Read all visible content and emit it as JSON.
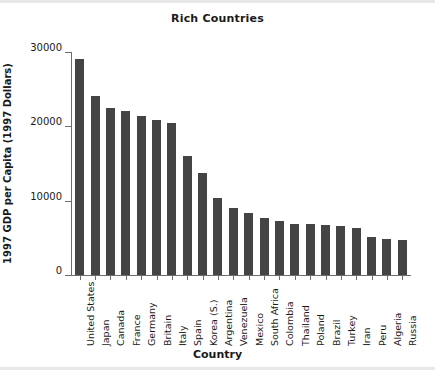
{
  "chart_data": {
    "type": "bar",
    "title": "Rich Countries",
    "xlabel": "Country",
    "ylabel": "1997 GDP per Capita (1997 Dollars)",
    "ylim": [
      0,
      30000
    ],
    "yticks": [
      0,
      10000,
      20000,
      30000
    ],
    "ytick_labels": [
      "0",
      "10000",
      "20000",
      "30000"
    ],
    "grid": false,
    "legend": false,
    "bar_color": "#444444",
    "axis_color": "#6e6e6e",
    "background": "#ffffff",
    "categories": [
      "United States",
      "Japan",
      "Canada",
      "France",
      "Germany",
      "Britain",
      "Italy",
      "Spain",
      "Korea (S.)",
      "Argentina",
      "Venezuela",
      "Mexico",
      "South Africa",
      "Colombia",
      "Thailand",
      "Poland",
      "Brazil",
      "Turkey",
      "Iran",
      "Peru",
      "Algeria",
      "Russia"
    ],
    "values": [
      29000,
      24100,
      22500,
      22100,
      21400,
      20900,
      20400,
      16000,
      13700,
      10400,
      9000,
      8400,
      7700,
      7200,
      6900,
      6800,
      6700,
      6600,
      6300,
      5100,
      4900,
      4700
    ],
    "series": [
      {
        "name": "1997 GDP per Capita",
        "values": [
          29000,
          24100,
          22500,
          22100,
          21400,
          20900,
          20400,
          16000,
          13700,
          10400,
          9000,
          8400,
          7700,
          7200,
          6900,
          6800,
          6700,
          6600,
          6300,
          5100,
          4900,
          4700
        ]
      }
    ]
  }
}
